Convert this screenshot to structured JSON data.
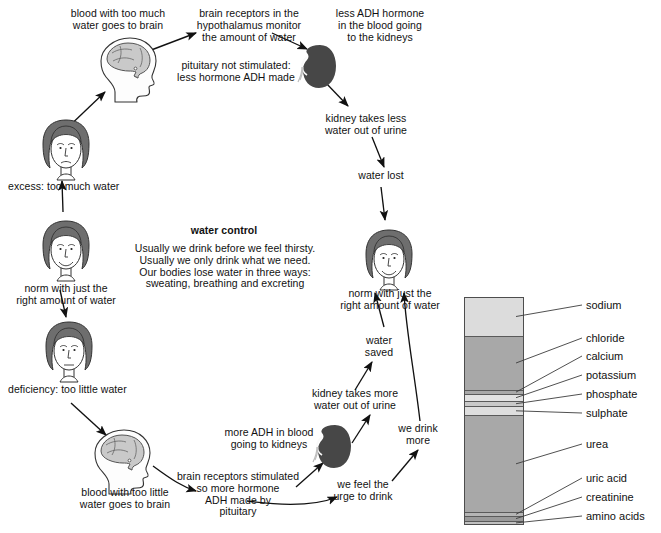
{
  "diagram": {
    "title": "water control",
    "center_text": "Usually we drink before we feel thirsty.\nUsually we only drink what we need.\nOur bodies lose water in three ways:\nsweating, breathing and excreting",
    "labels": {
      "blood_too_much": "blood with too much\nwater goes to brain",
      "brain_receptors_monitor": "brain receptors in the\nhypothalamus monitor\nthe amount of water",
      "less_adh": "less ADH hormone\nin the blood going\nto the kidneys",
      "pituitary_not_stimulated": "pituitary not stimulated:\nless hormone ADH made",
      "kidney_less_water": "kidney takes less\nwater out of urine",
      "water_lost": "water lost",
      "excess": "excess: too much water",
      "norm_left": "norm with just the\nright amount of water",
      "norm_right": "norm with just the\nright amount of water",
      "deficiency": "deficiency: too little water",
      "blood_too_little": "blood with too little\nwater goes to brain",
      "brain_receptors_stimulated": "brain receptors stimulated\nso more hormone\nADH made by\npituitary",
      "more_adh": "more ADH in blood\ngoing to kidneys",
      "we_feel_urge": "we feel the\nurge to drink",
      "we_drink_more": "we drink\nmore",
      "kidney_more_water": "kidney takes more\nwater out of urine",
      "water_saved": "water\nsaved"
    },
    "icons": {
      "head_brain": "head-with-brain-icon",
      "kidney": "kidney-icon",
      "face": "face-icon",
      "arrow": "arrow-icon"
    }
  },
  "chart_data": {
    "type": "bar",
    "title": "",
    "xlabel": "",
    "ylabel": "",
    "orientation": "stacked-vertical",
    "grid": false,
    "legend": "right-callouts",
    "categories": [
      "sodium",
      "chloride",
      "calcium",
      "potassium",
      "phosphate",
      "sulphate",
      "urea",
      "uric acid",
      "creatinine",
      "amino acids"
    ],
    "values": [
      17.1,
      23.7,
      1.8,
      3.1,
      2.2,
      4.0,
      42.5,
      1.8,
      2.0,
      1.8
    ],
    "unit": "percent of bar height",
    "colors": [
      "#dcdcdc",
      "#a8a8a8",
      "#a8a8a8",
      "#e2e2e2",
      "#c9c9c9",
      "#dedede",
      "#a8a8a8",
      "#b5b5b5",
      "#9a9a9a",
      "#c0c0c0"
    ],
    "ylim": [
      0,
      100
    ]
  }
}
